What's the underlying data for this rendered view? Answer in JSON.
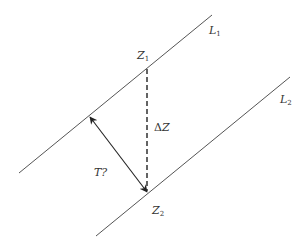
{
  "diagram": {
    "type": "geometry",
    "colors": {
      "line": "#555555",
      "arrow": "#222222",
      "text": "#333333",
      "background": "#ffffff"
    },
    "lines": [
      {
        "id": "L1",
        "label": "L",
        "subscript": "1",
        "x1": 19,
        "y1": 173,
        "x2": 212,
        "y2": 15
      },
      {
        "id": "L2",
        "label": "L",
        "subscript": "2",
        "x1": 96,
        "y1": 236,
        "x2": 290,
        "y2": 77
      }
    ],
    "points": [
      {
        "id": "Z1",
        "label": "Z",
        "subscript": "1"
      },
      {
        "id": "Z2",
        "label": "Z",
        "subscript": "2"
      }
    ],
    "dashed_segment": {
      "label_symbol": "Δ",
      "label": "Z",
      "x1": 147,
      "y1": 69,
      "x2": 147,
      "y2": 192
    },
    "double_arrow": {
      "label": "T?",
      "x1": 90,
      "y1": 117,
      "x2": 147,
      "y2": 192
    }
  }
}
